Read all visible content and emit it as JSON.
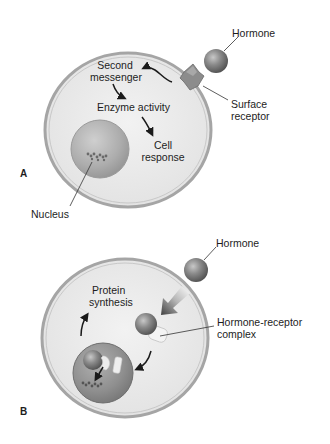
{
  "panels": [
    {
      "letter": "A",
      "labels": {
        "hormone": "Hormone",
        "second_messenger_1": "Second",
        "second_messenger_2": "messenger",
        "enzyme_activity": "Enzyme activity",
        "cell_response_1": "Cell",
        "cell_response_2": "response",
        "surface_receptor_1": "Surface",
        "surface_receptor_2": "receptor",
        "nucleus": "Nucleus"
      }
    },
    {
      "letter": "B",
      "labels": {
        "hormone": "Hormone",
        "protein_synthesis_1": "Protein",
        "protein_synthesis_2": "synthesis",
        "hormone_receptor_complex_1": "Hormone-receptor",
        "hormone_receptor_complex_2": "complex"
      }
    }
  ],
  "colors": {
    "cell_fill": "#e9e9e9",
    "cell_border": "#9a9a9a",
    "hormone": "#7a7a7a",
    "nucleus": "#a8a8a8",
    "receptor": "#8c8c8c",
    "arrow": "#1a1a1a"
  }
}
